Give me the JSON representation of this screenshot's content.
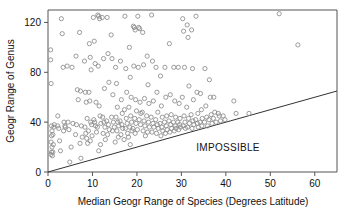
{
  "chart_data": {
    "type": "scatter",
    "title": "",
    "xlabel": "Median Geogr Range of Species (Degrees Latitude)",
    "ylabel": "Geogr Range of Genus",
    "xlim": [
      0,
      65
    ],
    "ylim": [
      0,
      130
    ],
    "xticks": [
      0,
      10,
      20,
      30,
      40,
      50,
      60
    ],
    "yticks": [
      0,
      40,
      80,
      120
    ],
    "xticklabels": [
      "0",
      "10",
      "20",
      "30",
      "40",
      "50",
      "60"
    ],
    "yticklabels": [
      "0",
      "40",
      "80",
      "120"
    ],
    "grid": false,
    "legend": null,
    "marker": "open-circle",
    "marker_color": "#8a8a8a",
    "annotations": [
      {
        "text": "IMPOSSIBLE",
        "x": 40.5,
        "y": 17,
        "name": "impossible-region-label"
      }
    ],
    "reference_line": {
      "name": "identity-boundary-line",
      "label": "y = x boundary",
      "x": [
        0,
        65
      ],
      "y": [
        0,
        65
      ],
      "color": "#333333"
    },
    "points": [
      [
        0.6,
        98
      ],
      [
        0.6,
        90
      ],
      [
        0.7,
        71
      ],
      [
        0.8,
        37
      ],
      [
        0.9,
        33
      ],
      [
        0.8,
        29
      ],
      [
        0.7,
        24
      ],
      [
        0.9,
        20
      ],
      [
        0.8,
        16
      ],
      [
        0.7,
        14
      ],
      [
        1.0,
        13
      ],
      [
        1.1,
        16
      ],
      [
        1.2,
        22
      ],
      [
        1.3,
        36
      ],
      [
        1.4,
        38
      ],
      [
        1.1,
        30
      ],
      [
        2.2,
        37
      ],
      [
        2.4,
        35
      ],
      [
        2.6,
        25
      ],
      [
        2.8,
        17
      ],
      [
        2.2,
        45
      ],
      [
        3.0,
        123
      ],
      [
        3.2,
        111
      ],
      [
        3.4,
        84
      ],
      [
        3.6,
        40
      ],
      [
        3.8,
        37
      ],
      [
        3.5,
        33
      ],
      [
        3.9,
        36
      ],
      [
        4.3,
        85
      ],
      [
        4.5,
        40
      ],
      [
        4.7,
        34
      ],
      [
        4.9,
        8
      ],
      [
        5.4,
        84
      ],
      [
        5.6,
        39
      ],
      [
        5.2,
        20
      ],
      [
        6.3,
        93
      ],
      [
        6.6,
        66
      ],
      [
        6.8,
        58
      ],
      [
        6.4,
        38
      ],
      [
        6.2,
        30
      ],
      [
        7.1,
        112
      ],
      [
        7.3,
        65
      ],
      [
        7.5,
        37
      ],
      [
        7.7,
        28
      ],
      [
        7.2,
        23
      ],
      [
        7.4,
        11
      ],
      [
        8.2,
        89
      ],
      [
        8.4,
        64
      ],
      [
        8.6,
        56
      ],
      [
        8.8,
        43
      ],
      [
        8.3,
        36
      ],
      [
        8.5,
        31
      ],
      [
        8.7,
        27
      ],
      [
        8.9,
        23
      ],
      [
        9.3,
        103
      ],
      [
        9.5,
        92
      ],
      [
        9.7,
        82
      ],
      [
        9.2,
        64
      ],
      [
        9.4,
        57
      ],
      [
        9.6,
        40
      ],
      [
        9.8,
        38
      ],
      [
        9.1,
        33
      ],
      [
        9.9,
        29
      ],
      [
        9.5,
        25
      ],
      [
        10.2,
        124
      ],
      [
        10.4,
        105
      ],
      [
        10.6,
        87
      ],
      [
        10.8,
        56
      ],
      [
        10.3,
        42
      ],
      [
        10.5,
        40
      ],
      [
        10.7,
        37
      ],
      [
        10.9,
        32
      ],
      [
        11.2,
        126
      ],
      [
        11.4,
        125
      ],
      [
        11.6,
        123
      ],
      [
        11.3,
        85
      ],
      [
        11.5,
        53
      ],
      [
        11.7,
        45
      ],
      [
        11.9,
        39
      ],
      [
        11.1,
        36
      ],
      [
        11.8,
        22
      ],
      [
        11.4,
        17
      ],
      [
        12.2,
        124
      ],
      [
        12.5,
        91
      ],
      [
        12.7,
        67
      ],
      [
        12.3,
        44
      ],
      [
        12.6,
        40
      ],
      [
        12.8,
        36
      ],
      [
        12.4,
        31
      ],
      [
        12.9,
        26
      ],
      [
        13.3,
        124
      ],
      [
        13.5,
        95
      ],
      [
        13.7,
        72
      ],
      [
        13.2,
        41
      ],
      [
        13.6,
        38
      ],
      [
        13.8,
        34
      ],
      [
        13.4,
        30
      ],
      [
        14.2,
        110
      ],
      [
        14.4,
        91
      ],
      [
        14.6,
        62
      ],
      [
        14.3,
        44
      ],
      [
        14.7,
        40
      ],
      [
        14.9,
        36
      ],
      [
        14.5,
        33
      ],
      [
        15.2,
        84
      ],
      [
        15.4,
        71
      ],
      [
        15.6,
        52
      ],
      [
        15.3,
        44
      ],
      [
        15.7,
        40
      ],
      [
        15.9,
        37
      ],
      [
        15.5,
        33
      ],
      [
        15.8,
        28
      ],
      [
        15.1,
        24
      ],
      [
        16.3,
        89
      ],
      [
        16.5,
        58
      ],
      [
        16.7,
        47
      ],
      [
        16.2,
        41
      ],
      [
        16.6,
        38
      ],
      [
        16.8,
        35
      ],
      [
        16.4,
        30
      ],
      [
        17.3,
        125
      ],
      [
        17.5,
        83
      ],
      [
        17.7,
        64
      ],
      [
        17.2,
        50
      ],
      [
        17.6,
        43
      ],
      [
        17.8,
        39
      ],
      [
        17.4,
        35
      ],
      [
        17.9,
        31
      ],
      [
        17.1,
        26
      ],
      [
        18.3,
        100
      ],
      [
        18.5,
        76
      ],
      [
        18.7,
        60
      ],
      [
        18.2,
        52
      ],
      [
        18.6,
        45
      ],
      [
        18.8,
        40
      ],
      [
        18.4,
        36
      ],
      [
        18.9,
        33
      ],
      [
        18.1,
        28
      ],
      [
        18.5,
        22
      ],
      [
        19.2,
        117
      ],
      [
        19.4,
        116
      ],
      [
        19.6,
        114
      ],
      [
        19.3,
        85
      ],
      [
        19.7,
        58
      ],
      [
        19.9,
        49
      ],
      [
        19.5,
        43
      ],
      [
        19.8,
        39
      ],
      [
        19.1,
        35
      ],
      [
        19.6,
        31
      ],
      [
        20.2,
        125
      ],
      [
        20.4,
        116
      ],
      [
        20.6,
        115
      ],
      [
        20.3,
        84
      ],
      [
        20.7,
        56
      ],
      [
        20.9,
        47
      ],
      [
        20.5,
        42
      ],
      [
        20.8,
        38
      ],
      [
        20.1,
        34
      ],
      [
        21.3,
        112
      ],
      [
        21.5,
        86
      ],
      [
        21.7,
        59
      ],
      [
        21.2,
        48
      ],
      [
        21.6,
        41
      ],
      [
        21.8,
        37
      ],
      [
        21.4,
        33
      ],
      [
        21.9,
        29
      ],
      [
        22.3,
        93
      ],
      [
        22.5,
        70
      ],
      [
        22.7,
        55
      ],
      [
        22.2,
        45
      ],
      [
        22.6,
        40
      ],
      [
        22.8,
        36
      ],
      [
        22.4,
        32
      ],
      [
        23.3,
        126
      ],
      [
        23.5,
        89
      ],
      [
        23.7,
        57
      ],
      [
        23.2,
        44
      ],
      [
        23.6,
        39
      ],
      [
        23.8,
        36
      ],
      [
        23.4,
        32
      ],
      [
        24.3,
        84
      ],
      [
        24.5,
        64
      ],
      [
        24.7,
        48
      ],
      [
        24.2,
        42
      ],
      [
        24.6,
        38
      ],
      [
        24.8,
        35
      ],
      [
        24.4,
        31
      ],
      [
        25.3,
        77
      ],
      [
        25.5,
        53
      ],
      [
        25.7,
        44
      ],
      [
        25.2,
        39
      ],
      [
        25.6,
        36
      ],
      [
        25.8,
        33
      ],
      [
        25.4,
        29
      ],
      [
        26.3,
        84
      ],
      [
        26.5,
        60
      ],
      [
        26.7,
        45
      ],
      [
        26.2,
        40
      ],
      [
        26.6,
        37
      ],
      [
        26.8,
        34
      ],
      [
        26.4,
        31
      ],
      [
        27.3,
        103
      ],
      [
        27.5,
        62
      ],
      [
        27.7,
        46
      ],
      [
        27.2,
        41
      ],
      [
        27.6,
        38
      ],
      [
        27.8,
        35
      ],
      [
        27.4,
        32
      ],
      [
        28.3,
        84
      ],
      [
        28.5,
        57
      ],
      [
        28.7,
        44
      ],
      [
        28.2,
        40
      ],
      [
        28.6,
        37
      ],
      [
        28.8,
        35
      ],
      [
        28.4,
        33
      ],
      [
        29.3,
        84
      ],
      [
        29.5,
        55
      ],
      [
        29.7,
        43
      ],
      [
        29.2,
        40
      ],
      [
        29.6,
        38
      ],
      [
        29.8,
        36
      ],
      [
        29.4,
        34
      ],
      [
        30.3,
        123
      ],
      [
        30.5,
        113
      ],
      [
        30.7,
        84
      ],
      [
        30.2,
        60
      ],
      [
        30.6,
        45
      ],
      [
        30.8,
        40
      ],
      [
        30.4,
        37
      ],
      [
        30.9,
        35
      ],
      [
        31.3,
        118
      ],
      [
        31.5,
        108
      ],
      [
        31.7,
        69
      ],
      [
        31.2,
        52
      ],
      [
        31.6,
        43
      ],
      [
        31.8,
        39
      ],
      [
        31.4,
        36
      ],
      [
        32.3,
        114
      ],
      [
        32.5,
        83
      ],
      [
        32.7,
        58
      ],
      [
        32.2,
        46
      ],
      [
        32.6,
        41
      ],
      [
        32.8,
        38
      ],
      [
        32.4,
        35
      ],
      [
        33.3,
        125
      ],
      [
        33.5,
        64
      ],
      [
        33.7,
        47
      ],
      [
        33.2,
        42
      ],
      [
        33.6,
        39
      ],
      [
        33.8,
        36
      ],
      [
        34.3,
        63
      ],
      [
        34.5,
        50
      ],
      [
        34.7,
        43
      ],
      [
        34.2,
        40
      ],
      [
        34.6,
        37
      ],
      [
        35.3,
        83
      ],
      [
        35.5,
        53
      ],
      [
        35.7,
        44
      ],
      [
        35.2,
        40
      ],
      [
        35.9,
        37
      ],
      [
        36.3,
        74
      ],
      [
        36.5,
        60
      ],
      [
        36.7,
        46
      ],
      [
        36.2,
        42
      ],
      [
        36.9,
        39
      ],
      [
        37.3,
        60
      ],
      [
        37.5,
        48
      ],
      [
        37.2,
        43
      ],
      [
        37.8,
        40
      ],
      [
        38.3,
        47
      ],
      [
        38.5,
        45
      ],
      [
        38.8,
        41
      ],
      [
        39.4,
        45
      ],
      [
        39.8,
        42
      ],
      [
        41.8,
        57
      ],
      [
        42.3,
        47
      ],
      [
        45.2,
        47
      ],
      [
        52.0,
        127
      ],
      [
        56.2,
        102
      ]
    ]
  }
}
